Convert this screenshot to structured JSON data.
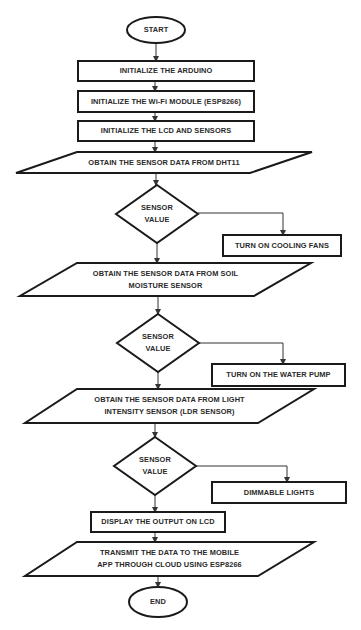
{
  "diagram": {
    "type": "flowchart",
    "colors": {
      "stroke": "#1a1a1a",
      "text": "#2a2a2a",
      "background": "#ffffff"
    },
    "nodes": [
      {
        "id": "start",
        "shape": "oval",
        "label": "START",
        "x": 127,
        "y": 17,
        "w": 58,
        "h": 26
      },
      {
        "id": "init_arduino",
        "shape": "rect",
        "label": "INITIALIZE THE ARDUINO",
        "x": 78,
        "y": 61,
        "w": 176,
        "h": 20
      },
      {
        "id": "init_wifi",
        "shape": "rect",
        "label": "INITIALIZE THE Wi-Fi MODULE (ESP8266)",
        "x": 78,
        "y": 91,
        "w": 176,
        "h": 21
      },
      {
        "id": "init_lcd",
        "shape": "rect",
        "label": "INITIALIZE THE LCD AND SENSORS",
        "x": 78,
        "y": 121,
        "w": 176,
        "h": 20
      },
      {
        "id": "obtain_dht11",
        "shape": "parallelogram",
        "label": "OBTAIN THE SENSOR DATA FROM DHT11",
        "pts": [
          [
            77,
            152
          ],
          [
            312,
            152
          ],
          [
            250,
            173
          ],
          [
            16,
            173
          ]
        ]
      },
      {
        "id": "decision1",
        "shape": "diamond",
        "label": "SENSOR\nVALUE",
        "cx": 157,
        "cy": 214,
        "hw": 41,
        "hh": 29
      },
      {
        "id": "cooling_fans",
        "shape": "rect",
        "label": "TURN ON COOLING FANS",
        "x": 223,
        "y": 235,
        "w": 118,
        "h": 21
      },
      {
        "id": "obtain_soil",
        "shape": "parallelogram",
        "label": "OBTAIN THE SENSOR DATA FROM SOIL\nMOISTURE SENSOR",
        "pts": [
          [
            77,
            263
          ],
          [
            311,
            263
          ],
          [
            254,
            296
          ],
          [
            20,
            296
          ]
        ]
      },
      {
        "id": "decision2",
        "shape": "diamond",
        "label": "SENSOR\nVALUE",
        "cx": 158,
        "cy": 343,
        "hw": 41,
        "hh": 29
      },
      {
        "id": "water_pump",
        "shape": "rect",
        "label": "TURN ON THE WATER PUMP",
        "x": 212,
        "y": 364,
        "w": 133,
        "h": 22
      },
      {
        "id": "obtain_ldr",
        "shape": "parallelogram",
        "label": "OBTAIN THE SENSOR DATA FROM LIGHT\nINTENSITY SENSOR (LDR SENSOR)",
        "pts": [
          [
            77,
            389
          ],
          [
            314,
            389
          ],
          [
            258,
            423
          ],
          [
            25,
            423
          ]
        ]
      },
      {
        "id": "decision3",
        "shape": "diamond",
        "label": "SENSOR\nVALUE",
        "cx": 155,
        "cy": 466,
        "hw": 41,
        "hh": 29
      },
      {
        "id": "dimmable_lights",
        "shape": "rect",
        "label": "DIMMABLE LIGHTS",
        "x": 212,
        "y": 482,
        "w": 134,
        "h": 21
      },
      {
        "id": "display_lcd",
        "shape": "rect",
        "label": "DISPLAY THE OUTPUT ON LCD",
        "x": 91,
        "y": 512,
        "w": 134,
        "h": 20
      },
      {
        "id": "transmit",
        "shape": "parallelogram",
        "label": "TRANSMIT THE DATA TO THE MOBILE\nAPP THROUGH CLOUD USING ESP8266",
        "pts": [
          [
            77,
            542
          ],
          [
            314,
            542
          ],
          [
            258,
            576
          ],
          [
            25,
            576
          ]
        ]
      },
      {
        "id": "end",
        "shape": "oval",
        "label": "END",
        "x": 129,
        "y": 587,
        "w": 58,
        "h": 30
      }
    ],
    "edges": [
      {
        "from": "start",
        "to": "init_arduino",
        "path": [
          [
            156,
            43
          ],
          [
            156,
            61
          ]
        ]
      },
      {
        "from": "init_arduino",
        "to": "init_wifi",
        "path": [
          [
            155,
            81
          ],
          [
            155,
            91
          ]
        ]
      },
      {
        "from": "init_wifi",
        "to": "init_lcd",
        "path": [
          [
            155,
            112
          ],
          [
            155,
            121
          ]
        ]
      },
      {
        "from": "init_lcd",
        "to": "obtain_dht11",
        "path": [
          [
            155,
            141
          ],
          [
            155,
            152
          ]
        ]
      },
      {
        "from": "obtain_dht11",
        "to": "decision1",
        "path": [
          [
            156,
            173
          ],
          [
            156,
            185
          ]
        ]
      },
      {
        "from": "decision1",
        "to": "cooling_fans",
        "path": [
          [
            198,
            213
          ],
          [
            283,
            213
          ],
          [
            283,
            235
          ]
        ]
      },
      {
        "from": "decision1",
        "to": "obtain_soil",
        "path": [
          [
            157,
            243
          ],
          [
            157,
            263
          ]
        ]
      },
      {
        "from": "obtain_soil",
        "to": "decision2",
        "path": [
          [
            158,
            296
          ],
          [
            158,
            314
          ]
        ]
      },
      {
        "from": "decision2",
        "to": "water_pump",
        "path": [
          [
            199,
            343
          ],
          [
            283,
            343
          ],
          [
            283,
            364
          ]
        ]
      },
      {
        "from": "decision2",
        "to": "obtain_ldr",
        "path": [
          [
            158,
            372
          ],
          [
            158,
            389
          ]
        ]
      },
      {
        "from": "obtain_ldr",
        "to": "decision3",
        "path": [
          [
            155,
            423
          ],
          [
            155,
            437
          ]
        ]
      },
      {
        "from": "decision3",
        "to": "dimmable_lights",
        "path": [
          [
            196,
            466
          ],
          [
            287,
            466
          ],
          [
            287,
            482
          ]
        ]
      },
      {
        "from": "decision3",
        "to": "display_lcd",
        "path": [
          [
            155,
            495
          ],
          [
            155,
            512
          ]
        ]
      },
      {
        "from": "display_lcd",
        "to": "transmit",
        "path": [
          [
            155,
            532
          ],
          [
            155,
            542
          ]
        ]
      },
      {
        "from": "transmit",
        "to": "end",
        "path": [
          [
            158,
            576
          ],
          [
            158,
            587
          ]
        ]
      }
    ]
  }
}
